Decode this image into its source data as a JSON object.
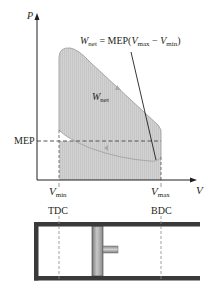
{
  "diagram": {
    "type": "P-V diagram with mean effective pressure and piston-cylinder",
    "axes": {
      "y_label": "P",
      "x_label": "V"
    },
    "equation": {
      "lhs": "W",
      "lhs_sub": "net",
      "eq": " = MEP(",
      "v1": "V",
      "v1_sub": "max",
      "minus": " − ",
      "v2": "V",
      "v2_sub": "min",
      "close": ")"
    },
    "cycle_label": {
      "main": "W",
      "sub": "net"
    },
    "mep_label": "MEP",
    "vmin_label": {
      "main": "V",
      "sub": "min"
    },
    "vmax_label": {
      "main": "V",
      "sub": "max"
    },
    "tdc_label": "TDC",
    "bdc_label": "BDC",
    "colors": {
      "cycle_fill": "#d4d4d4",
      "cycle_stroke": "#a8a8a8",
      "mep_fill": "#dcdcdc",
      "axis": "#231f20",
      "cylinder_wall": "#3a3a3a",
      "piston": "#9a9a9a"
    }
  }
}
